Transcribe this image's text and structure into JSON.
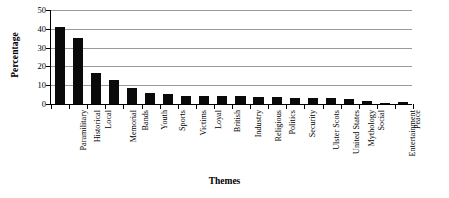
{
  "chart_data": {
    "type": "bar",
    "title": "",
    "xlabel": "Themes",
    "ylabel": "Percentage",
    "categories": [
      "Paramilitary",
      "Historical",
      "Local",
      "Memorial",
      "Bands",
      "Youth",
      "Sports",
      "Victims",
      "Loyal",
      "British",
      "Industry",
      "Religious",
      "Politics",
      "Security",
      "Ulster Scots",
      "United States",
      "Mythology",
      "Social",
      "Entertainment",
      "Peace"
    ],
    "values": [
      41,
      35,
      16.5,
      13,
      8.5,
      6,
      5.5,
      4.5,
      4,
      4,
      4,
      3.5,
      3.5,
      3,
      3,
      3,
      2.5,
      1.5,
      0.8,
      1
    ],
    "ylim": [
      0,
      50
    ],
    "yticks": [
      0,
      10,
      20,
      30,
      40,
      50
    ],
    "ytick_labels": [
      "0",
      "10",
      "20",
      "30",
      "40",
      "50"
    ],
    "grid": true,
    "legend": false,
    "bar_color": "#0a0a0a",
    "gridline_color": "#9a9a9a",
    "axis_color": "#000000",
    "background": "#ffffff"
  },
  "axes": {
    "y_title": "Percentage",
    "x_title": "Themes"
  }
}
